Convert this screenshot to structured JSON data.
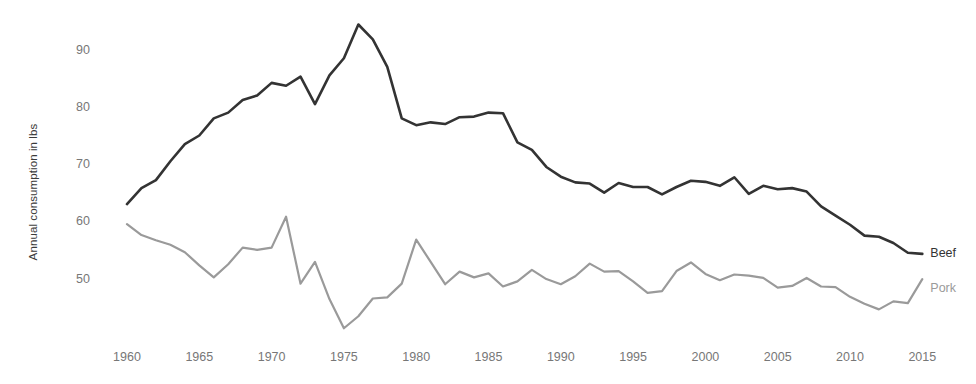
{
  "chart_data": {
    "type": "line",
    "title": "",
    "xlabel": "",
    "ylabel": "Annual consumption in lbs",
    "xlim": [
      1960,
      2015
    ],
    "ylim": [
      40,
      96
    ],
    "grid": false,
    "legend_position": "right-end-of-line",
    "xticks": [
      1960,
      1965,
      1970,
      1975,
      1980,
      1985,
      1990,
      1995,
      2000,
      2005,
      2010,
      2015
    ],
    "xticklabels": [
      "1960",
      "1965",
      "1970",
      "1975",
      "1980",
      "1985",
      "1990",
      "1995",
      "2000",
      "2005",
      "2010",
      "2015"
    ],
    "yticks": [
      50,
      60,
      70,
      80,
      90
    ],
    "yticklabels": [
      "50",
      "60",
      "70",
      "80",
      "90"
    ],
    "x": [
      1960,
      1961,
      1962,
      1963,
      1964,
      1965,
      1966,
      1967,
      1968,
      1969,
      1970,
      1971,
      1972,
      1973,
      1974,
      1975,
      1976,
      1977,
      1978,
      1979,
      1980,
      1981,
      1982,
      1983,
      1984,
      1985,
      1986,
      1987,
      1988,
      1989,
      1990,
      1991,
      1992,
      1993,
      1994,
      1995,
      1996,
      1997,
      1998,
      1999,
      2000,
      2001,
      2002,
      2003,
      2004,
      2005,
      2006,
      2007,
      2008,
      2009,
      2010,
      2011,
      2012,
      2013,
      2014,
      2015
    ],
    "series": [
      {
        "name": "Beef",
        "color": "#333333",
        "label_x": 2015,
        "values": [
          63.0,
          65.8,
          67.2,
          70.5,
          73.5,
          75.0,
          78.0,
          79.0,
          81.2,
          82.0,
          84.2,
          83.7,
          85.3,
          80.5,
          85.5,
          88.5,
          94.4,
          91.8,
          87.0,
          78.0,
          76.8,
          77.3,
          77.0,
          78.2,
          78.3,
          79.0,
          78.9,
          73.8,
          72.5,
          69.5,
          67.8,
          66.8,
          66.6,
          65.0,
          66.7,
          66.0,
          66.0,
          64.7,
          66.0,
          67.1,
          66.9,
          66.2,
          67.7,
          64.8,
          66.2,
          65.6,
          65.8,
          65.2,
          62.6,
          61.0,
          59.4,
          57.5,
          57.3,
          56.2,
          54.5,
          54.3
        ]
      },
      {
        "name": "Pork",
        "color": "#9a9a9a",
        "label_x": 2015,
        "values": [
          59.5,
          57.6,
          56.7,
          55.9,
          54.6,
          52.3,
          50.2,
          52.5,
          55.4,
          55.0,
          55.4,
          60.8,
          49.1,
          52.9,
          46.4,
          41.3,
          43.4,
          46.5,
          46.7,
          49.1,
          56.8,
          52.9,
          49.0,
          51.2,
          50.2,
          50.9,
          48.6,
          49.5,
          51.5,
          49.9,
          49.0,
          50.4,
          52.6,
          51.2,
          51.3,
          49.5,
          47.5,
          47.8,
          51.3,
          52.8,
          50.8,
          49.7,
          50.7,
          50.5,
          50.1,
          48.4,
          48.7,
          50.1,
          48.6,
          48.5,
          46.8,
          45.6,
          44.6,
          46.0,
          45.7,
          49.9
        ]
      }
    ]
  },
  "axis": {
    "y_title": "Annual consumption in lbs"
  }
}
